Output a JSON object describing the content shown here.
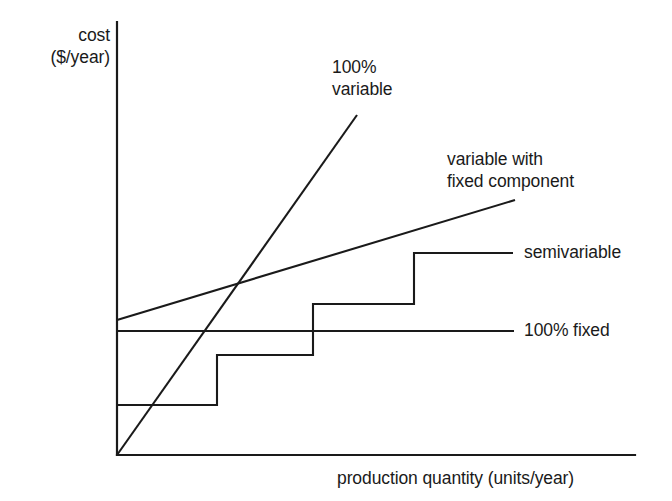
{
  "figure": {
    "background_color": "#ffffff",
    "ink_color": "#1a1a1a"
  },
  "axes": {
    "y_label_line1": "cost",
    "y_label_line2": "($/year)",
    "y_label_text": "cost ($/year)",
    "x_label_text": "production quantity (units/year)"
  },
  "labels": {
    "variable_100_line1": "100%",
    "variable_100_line2": "variable",
    "variable_fixed_line1": "variable with",
    "variable_fixed_line2": "fixed component",
    "semivariable": "semivariable",
    "fixed_100": "100% fixed"
  },
  "chart_data": {
    "type": "line",
    "title": "",
    "xlabel": "production quantity (units/year)",
    "ylabel": "cost ($/year)",
    "xlim": [
      0,
      100
    ],
    "ylim": [
      0,
      100
    ],
    "grid": false,
    "legend": "inline annotations at right of each curve",
    "axis_ticks": {
      "x": [],
      "y": []
    },
    "series": [
      {
        "name": "100% variable",
        "shape": "straight line through origin",
        "annotation": "100% variable",
        "points_px": [
          [
            117,
            455
          ],
          [
            357,
            115
          ]
        ],
        "x": [
          0,
          57
        ],
        "y": [
          0,
          78
        ],
        "intercept": 0,
        "slope": 1.37
      },
      {
        "name": "variable with fixed component",
        "shape": "straight line with positive y-intercept",
        "annotation": "variable with fixed component",
        "points_px": [
          [
            117,
            320
          ],
          [
            515,
            200
          ]
        ],
        "x": [
          0,
          95
        ],
        "y": [
          31,
          59
        ],
        "intercept": 31,
        "slope": 0.29
      },
      {
        "name": "semivariable",
        "shape": "step function, four levels",
        "annotation": "semivariable",
        "points_px": [
          [
            117,
            405
          ],
          [
            217,
            405
          ],
          [
            217,
            355
          ],
          [
            313,
            355
          ],
          [
            313,
            304
          ],
          [
            414,
            304
          ],
          [
            414,
            253
          ],
          [
            513,
            253
          ]
        ],
        "steps": [
          {
            "x_start": 0,
            "x_end": 24,
            "y": 12
          },
          {
            "x_start": 24,
            "x_end": 47,
            "y": 23
          },
          {
            "x_start": 47,
            "x_end": 71,
            "y": 35
          },
          {
            "x_start": 71,
            "x_end": 95,
            "y": 47
          }
        ]
      },
      {
        "name": "100% fixed",
        "shape": "horizontal line",
        "annotation": "100% fixed",
        "points_px": [
          [
            117,
            331
          ],
          [
            514,
            331
          ]
        ],
        "x": [
          0,
          95
        ],
        "y": [
          29,
          29
        ],
        "intercept": 29,
        "slope": 0
      }
    ]
  }
}
